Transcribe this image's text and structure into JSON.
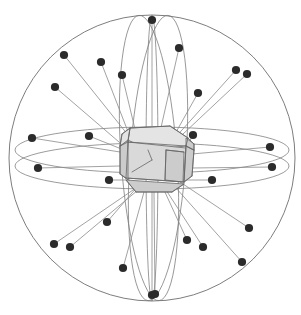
{
  "figure": {
    "kind": "coordination-sphere-diagram",
    "background_color": "#ffffff",
    "width": 301,
    "height": 315
  },
  "colors": {
    "sphere_stroke": "#6e6e6e",
    "great_circle_stroke": "#7a7a7a",
    "radial_stroke": "#8a8a8a",
    "dot_fill": "#2b2b2b",
    "polyhedron_fill": "#d9d9d9",
    "polyhedron_fill_light": "#e4e4e4",
    "polyhedron_fill_dark": "#cccccc",
    "polyhedron_stroke": "#666666"
  },
  "sphere": {
    "center_x": 152,
    "center_y": 158,
    "radius": 143,
    "stroke_width": 0.9
  },
  "great_circles": [
    {
      "name": "equatorial-upper",
      "cx": 152,
      "cy": 150,
      "rx": 137,
      "ry": 23,
      "rotation": 0
    },
    {
      "name": "equatorial-lower",
      "cx": 152,
      "cy": 166,
      "rx": 137,
      "ry": 23,
      "rotation": 0
    },
    {
      "name": "meridian-left",
      "cx": 149,
      "cy": 158,
      "rx": 28,
      "ry": 143,
      "rotation": -4
    },
    {
      "name": "meridian-right",
      "cx": 158,
      "cy": 158,
      "rx": 28,
      "ry": 143,
      "rotation": 4
    },
    {
      "name": "meridian-center",
      "cx": 152,
      "cy": 158,
      "rx": 6,
      "ry": 143,
      "rotation": 0
    }
  ],
  "polyhedron": {
    "name": "truncated-cube-core",
    "center_x": 152,
    "center_y": 158,
    "radius": 36,
    "faces": [
      {
        "id": "top-face",
        "shade": "light",
        "points": "130,128 170,126 188,138 186,146 148,150 128,140"
      },
      {
        "id": "front-face",
        "shade": "base",
        "points": "128,142 186,148 184,182 126,178"
      },
      {
        "id": "bottom-face",
        "shade": "dark",
        "points": "126,180 184,184 172,192 136,192"
      },
      {
        "id": "left-bevel",
        "shade": "dark",
        "points": "120,146 128,140 128,180 120,174"
      },
      {
        "id": "right-bevel",
        "shade": "dark",
        "points": "186,146 194,150 192,176 184,182"
      },
      {
        "id": "top-left-corner",
        "shade": "light",
        "points": "120,146 128,140 130,128 122,134"
      },
      {
        "id": "top-right-corner",
        "shade": "dark",
        "points": "186,138 194,144 194,150 186,146"
      },
      {
        "id": "inner-right-panel",
        "shade": "dark",
        "points": "166,150 184,152 183,182 165,180"
      }
    ],
    "edges": [
      "130,128 170,126",
      "170,126 188,138",
      "188,138 186,146",
      "186,146 128,142",
      "128,142 130,128",
      "128,142 120,146",
      "120,146 122,134",
      "122,134 130,128",
      "126,178 128,142",
      "184,182 186,146",
      "126,178 184,182",
      "120,174 126,178",
      "120,146 120,174",
      "192,176 194,150",
      "194,150 186,146",
      "184,182 192,176",
      "136,192 126,180",
      "136,192 172,192",
      "172,192 184,184",
      "166,150 184,152",
      "166,150 165,180",
      "152,160 132,172",
      "148,150 152,160",
      "188,138 194,144",
      "194,144 194,150"
    ]
  },
  "ligand_vectors": {
    "description": "radial vectors from core centre to coordination vertices",
    "stroke_width": 0.8,
    "dot_radius": 4.1,
    "origin_x": 152,
    "origin_y": 158,
    "vertices": [
      {
        "id": "v01",
        "x": 152,
        "y": 20,
        "origin_x": 152,
        "origin_y": 126
      },
      {
        "id": "v02",
        "x": 179,
        "y": 48,
        "origin_x": 160,
        "origin_y": 132
      },
      {
        "id": "v03",
        "x": 64,
        "y": 55,
        "origin_x": 132,
        "origin_y": 140
      },
      {
        "id": "v04",
        "x": 101,
        "y": 62,
        "origin_x": 132,
        "origin_y": 142
      },
      {
        "id": "v05",
        "x": 122,
        "y": 75,
        "origin_x": 140,
        "origin_y": 150
      },
      {
        "id": "v06",
        "x": 236,
        "y": 70,
        "origin_x": 164,
        "origin_y": 150
      },
      {
        "id": "v07",
        "x": 247,
        "y": 74,
        "origin_x": 166,
        "origin_y": 150
      },
      {
        "id": "v08",
        "x": 55,
        "y": 87,
        "origin_x": 126,
        "origin_y": 148
      },
      {
        "id": "v09",
        "x": 198,
        "y": 93,
        "origin_x": 166,
        "origin_y": 150
      },
      {
        "id": "v10",
        "x": 89,
        "y": 136,
        "origin_x": 124,
        "origin_y": 150
      },
      {
        "id": "v11",
        "x": 193,
        "y": 135,
        "origin_x": 186,
        "origin_y": 148
      },
      {
        "id": "v12",
        "x": 32,
        "y": 138,
        "origin_x": 120,
        "origin_y": 152
      },
      {
        "id": "v13",
        "x": 270,
        "y": 147,
        "origin_x": 192,
        "origin_y": 154
      },
      {
        "id": "v14",
        "x": 38,
        "y": 168,
        "origin_x": 120,
        "origin_y": 166
      },
      {
        "id": "v15",
        "x": 272,
        "y": 167,
        "origin_x": 192,
        "origin_y": 168
      },
      {
        "id": "v16",
        "x": 109,
        "y": 180,
        "origin_x": 126,
        "origin_y": 180
      },
      {
        "id": "v17",
        "x": 212,
        "y": 180,
        "origin_x": 186,
        "origin_y": 180
      },
      {
        "id": "v18",
        "x": 107,
        "y": 222,
        "origin_x": 138,
        "origin_y": 186
      },
      {
        "id": "v19",
        "x": 249,
        "y": 228,
        "origin_x": 180,
        "origin_y": 182
      },
      {
        "id": "v20",
        "x": 187,
        "y": 240,
        "origin_x": 164,
        "origin_y": 190
      },
      {
        "id": "v21",
        "x": 54,
        "y": 244,
        "origin_x": 136,
        "origin_y": 188
      },
      {
        "id": "v22",
        "x": 70,
        "y": 247,
        "origin_x": 138,
        "origin_y": 190
      },
      {
        "id": "v23",
        "x": 203,
        "y": 247,
        "origin_x": 166,
        "origin_y": 190
      },
      {
        "id": "v24",
        "x": 242,
        "y": 262,
        "origin_x": 176,
        "origin_y": 188
      },
      {
        "id": "v25",
        "x": 123,
        "y": 268,
        "origin_x": 144,
        "origin_y": 192
      },
      {
        "id": "v26",
        "x": 152,
        "y": 295,
        "origin_x": 152,
        "origin_y": 192
      },
      {
        "id": "v27",
        "x": 155,
        "y": 294,
        "origin_x": 154,
        "origin_y": 192
      }
    ]
  }
}
